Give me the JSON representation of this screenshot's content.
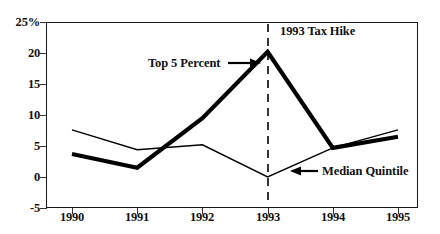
{
  "chart_data": {
    "type": "line",
    "title": "",
    "xlabel": "",
    "ylabel": "",
    "x": [
      1990,
      1991,
      1992,
      1993,
      1994,
      1995
    ],
    "categories": [
      "1990",
      "1991",
      "1992",
      "1993",
      "1994",
      "1995"
    ],
    "series": [
      {
        "name": "Top 5 Percent",
        "values": [
          3.7,
          1.5,
          9.5,
          20.2,
          4.7,
          6.5
        ],
        "style": "thick",
        "color": "#000000"
      },
      {
        "name": "Median Quintile",
        "values": [
          7.6,
          4.4,
          5.2,
          0.0,
          4.7,
          7.6
        ],
        "style": "thin",
        "color": "#000000"
      }
    ],
    "ylim": [
      -5,
      25
    ],
    "yticks": [
      -5,
      0,
      5,
      10,
      15,
      20,
      25
    ],
    "ytick_labels": [
      "-5",
      "0",
      "5",
      "10",
      "15",
      "20",
      "25%"
    ],
    "xtick_labels": [
      "1990",
      "1991",
      "1992",
      "1993",
      "1994",
      "1995"
    ],
    "grid": true,
    "legend": "none",
    "annotations": [
      {
        "id": "top5",
        "text": "Top 5 Percent",
        "arrow": "right",
        "target_x": 1993,
        "target_y": 20.2
      },
      {
        "id": "taxhike",
        "text": "1993 Tax Hike",
        "arrow": "none",
        "target_x": 1993
      },
      {
        "id": "median",
        "text": "Median Quintile",
        "arrow": "left",
        "target_x": 1993.5,
        "target_y": 2.0
      }
    ],
    "vertical_markers": [
      {
        "at": 1993,
        "style": "dashed",
        "color": "#000000"
      }
    ]
  },
  "axis": {
    "y_labels": [
      "25%",
      "20",
      "15",
      "10",
      "5",
      "0",
      "-5"
    ],
    "x_labels": [
      "1990",
      "1991",
      "1992",
      "1993",
      "1994",
      "1995"
    ]
  },
  "annotations": {
    "top5_label": "Top 5 Percent",
    "taxhike_label": "1993 Tax Hike",
    "median_label": "Median Quintile"
  },
  "colors": {
    "series_line": "#000000",
    "gridline": "#b3b3b3",
    "frame": "#1a1a1a",
    "background": "#ffffff",
    "text": "#111111"
  }
}
